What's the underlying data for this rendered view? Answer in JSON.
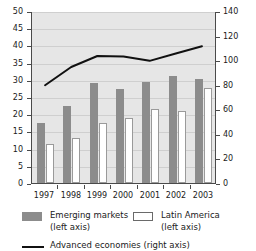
{
  "chart_data": {
    "type": "bar",
    "title": "",
    "subtitle": "",
    "xlabel": "",
    "ylabel": "",
    "categories": [
      "1997",
      "1998",
      "1999",
      "2000",
      "2001",
      "2002",
      "2003"
    ],
    "series": [
      {
        "name": "Emerging markets (left axis)",
        "type": "bar",
        "axis": "left",
        "color": "#8c8c8c",
        "values": [
          17.4,
          22.5,
          29.0,
          27.2,
          29.3,
          31.2,
          30.3
        ]
      },
      {
        "name": "Latin America (left axis)",
        "type": "bar",
        "axis": "left",
        "color": "#ffffff",
        "values": [
          11.2,
          13.1,
          17.5,
          18.8,
          21.5,
          20.9,
          27.5
        ]
      },
      {
        "name": "Advanced economies (right axis)",
        "type": "line",
        "axis": "right",
        "color": "#111111",
        "values": [
          80,
          95,
          104,
          103.5,
          100,
          106,
          112
        ]
      }
    ],
    "left_axis": {
      "label": "",
      "min": 0,
      "max": 50,
      "step": 5,
      "ticks": [
        "0",
        "5",
        "10",
        "15",
        "20",
        "25",
        "30",
        "35",
        "40",
        "45",
        "50"
      ]
    },
    "right_axis": {
      "label": "",
      "min": 0,
      "max": 140,
      "step": 20,
      "ticks": [
        "0",
        "20",
        "40",
        "60",
        "80",
        "100",
        "120",
        "140"
      ]
    },
    "grid": true,
    "legend_position": "bottom",
    "plot_background": "#e6e6e6"
  },
  "legend": {
    "emerging": {
      "line1": "Emerging markets",
      "line2": "(left axis)"
    },
    "latin": {
      "line1": "Latin America",
      "line2": "(left axis)"
    },
    "advanced": {
      "line1": "Advanced economies (right axis)"
    }
  }
}
